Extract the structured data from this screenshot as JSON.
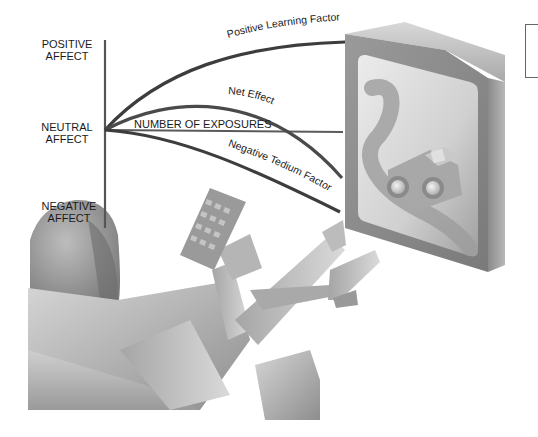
{
  "diagram": {
    "y_axis_labels": {
      "top": [
        "POSITIVE",
        "AFFECT"
      ],
      "middle": [
        "NEUTRAL",
        "AFFECT"
      ],
      "bottom": [
        "NEGATIVE",
        "AFFECT"
      ]
    },
    "x_axis_label": "NUMBER OF EXPOSURES",
    "curves": [
      {
        "name": "Positive Learning Factor",
        "trend": "rising, leveling off",
        "color": "#3a3a3a"
      },
      {
        "name": "Net Effect",
        "trend": "rises then falls below neutral",
        "color": "#4a4a4a"
      },
      {
        "name": "Negative Tedium Factor",
        "trend": "falling, accelerating",
        "color": "#3a3a3a"
      }
    ],
    "illustration": "Person reclining with remote control watching television showing a toy car on a winding road"
  },
  "colors": {
    "background": "#ffffff",
    "curve": "#3d3d3d",
    "axis": "#555555",
    "text": "#1a1a1a"
  }
}
